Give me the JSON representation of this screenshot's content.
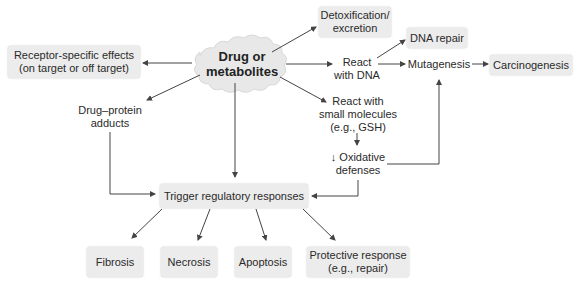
{
  "diagram": {
    "center": {
      "line1": "Drug or",
      "line2": "metabolites"
    },
    "nodes": {
      "receptor": {
        "line1": "Receptor-specific effects",
        "line2": "(on target or off target)"
      },
      "detox": {
        "line1": "Detoxification/",
        "line2": "excretion"
      },
      "dna_repair": {
        "label": "DNA repair"
      },
      "react_dna": {
        "line1": "React",
        "line2": "with DNA"
      },
      "mutagenesis": {
        "label": "Mutagenesis"
      },
      "carcinogenesis": {
        "label": "Carcinogenesis"
      },
      "adducts": {
        "line1": "Drug–protein",
        "line2": "adducts"
      },
      "small_molecules": {
        "line1": "React with",
        "line2": "small molecules",
        "line3": "(e.g., GSH)"
      },
      "oxidative": {
        "line1": "↓ Oxidative",
        "line2": "defenses"
      },
      "trigger": {
        "label": "Trigger regulatory responses"
      },
      "fibrosis": {
        "label": "Fibrosis"
      },
      "necrosis": {
        "label": "Necrosis"
      },
      "apoptosis": {
        "label": "Apoptosis"
      },
      "protective": {
        "line1": "Protective response",
        "line2": "(e.g., repair)"
      }
    },
    "colors": {
      "box_fill": "#ececec",
      "arrow": "#444444",
      "cloud_fill": "#e8e8e8"
    }
  }
}
